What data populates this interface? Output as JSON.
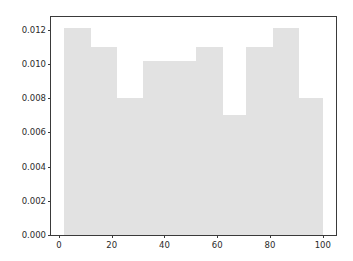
{
  "chart_data": {
    "type": "bar",
    "title": "",
    "subtitle": "",
    "xlabel": "",
    "ylabel": "",
    "xlim": [
      -3.0,
      105.0
    ],
    "ylim": [
      0.0,
      0.01275
    ],
    "grid": false,
    "legend": null,
    "bin_edges": [
      2,
      12,
      22,
      32,
      42,
      52,
      62,
      71,
      81,
      91,
      100
    ],
    "categories": [
      "2-12",
      "12-22",
      "22-32",
      "32-42",
      "42-52",
      "52-62",
      "62-71",
      "71-81",
      "81-91",
      "91-100"
    ],
    "values": [
      0.0121,
      0.011,
      0.008,
      0.0102,
      0.0102,
      0.011,
      0.007,
      0.011,
      0.0121,
      0.008
    ],
    "bar_color": "#e2e2e2",
    "xticks": [
      {
        "value": 0,
        "label": "0"
      },
      {
        "value": 20,
        "label": "20"
      },
      {
        "value": 40,
        "label": "40"
      },
      {
        "value": 60,
        "label": "60"
      },
      {
        "value": 80,
        "label": "80"
      },
      {
        "value": 100,
        "label": "100"
      }
    ],
    "yticks": [
      {
        "value": 0.0,
        "label": "0.000"
      },
      {
        "value": 0.002,
        "label": "0.002"
      },
      {
        "value": 0.004,
        "label": "0.004"
      },
      {
        "value": 0.006,
        "label": "0.006"
      },
      {
        "value": 0.008,
        "label": "0.008"
      },
      {
        "value": 0.01,
        "label": "0.010"
      },
      {
        "value": 0.012,
        "label": "0.012"
      }
    ]
  }
}
